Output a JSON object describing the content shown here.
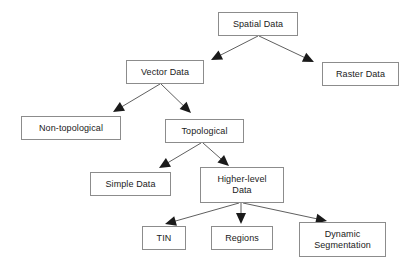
{
  "diagram": {
    "type": "tree-flowchart",
    "canvas": {
      "width": 415,
      "height": 269
    },
    "style": {
      "background": "#ffffff",
      "box_fill": "#ffffff",
      "box_border": "#8c8c8c",
      "text_color": "#1a1a1a",
      "edge_color": "#4d4d4d",
      "arrowhead_color": "#1a1a1a"
    },
    "nodes": [
      {
        "id": "spatial-data",
        "label": "Spatial Data",
        "x": 218,
        "y": 12,
        "w": 80,
        "h": 24
      },
      {
        "id": "vector-data",
        "label": "Vector Data",
        "x": 126,
        "y": 60,
        "w": 78,
        "h": 24
      },
      {
        "id": "raster-data",
        "label": "Raster Data",
        "x": 322,
        "y": 62,
        "w": 77,
        "h": 24
      },
      {
        "id": "non-topological",
        "label": "Non-topological",
        "x": 21,
        "y": 116,
        "w": 100,
        "h": 24
      },
      {
        "id": "topological",
        "label": "Topological",
        "x": 165,
        "y": 119,
        "w": 79,
        "h": 24
      },
      {
        "id": "simple-data",
        "label": "Simple Data",
        "x": 90,
        "y": 172,
        "w": 81,
        "h": 24
      },
      {
        "id": "higher-level-data",
        "label": "Higher-level\nData",
        "x": 200,
        "y": 167,
        "w": 84,
        "h": 36
      },
      {
        "id": "tin",
        "label": "TIN",
        "x": 142,
        "y": 226,
        "w": 44,
        "h": 24
      },
      {
        "id": "regions",
        "label": "Regions",
        "x": 211,
        "y": 226,
        "w": 62,
        "h": 24
      },
      {
        "id": "dynamic-segmentation",
        "label": "Dynamic\nSegmentation",
        "x": 299,
        "y": 222,
        "w": 87,
        "h": 35
      }
    ],
    "edges": [
      {
        "id": "spatial-to-vector",
        "from": "spatial-data",
        "to": "vector-data",
        "x1": 258,
        "y1": 36,
        "x2": 211,
        "y2": 60
      },
      {
        "id": "spatial-to-raster",
        "from": "spatial-data",
        "to": "raster-data",
        "x1": 259,
        "y1": 36,
        "x2": 314,
        "y2": 62
      },
      {
        "id": "vector-to-non-topological",
        "from": "vector-data",
        "to": "non-topological",
        "x1": 160,
        "y1": 84,
        "x2": 113,
        "y2": 112
      },
      {
        "id": "vector-to-topological",
        "from": "vector-data",
        "to": "topological",
        "x1": 161,
        "y1": 84,
        "x2": 191,
        "y2": 113
      },
      {
        "id": "topological-to-simple",
        "from": "topological",
        "to": "simple-data",
        "x1": 201,
        "y1": 143,
        "x2": 159,
        "y2": 168
      },
      {
        "id": "topological-to-higher-level",
        "from": "topological",
        "to": "higher-level-data",
        "x1": 203,
        "y1": 143,
        "x2": 229,
        "y2": 166
      },
      {
        "id": "higher-level-to-tin",
        "from": "higher-level-data",
        "to": "tin",
        "x1": 239,
        "y1": 203,
        "x2": 165,
        "y2": 224
      },
      {
        "id": "higher-level-to-regions",
        "from": "higher-level-data",
        "to": "regions",
        "x1": 241,
        "y1": 203,
        "x2": 241,
        "y2": 224
      },
      {
        "id": "higher-level-to-dynamic-seg",
        "from": "higher-level-data",
        "to": "dynamic-segmentation",
        "x1": 243,
        "y1": 203,
        "x2": 327,
        "y2": 221
      }
    ]
  }
}
